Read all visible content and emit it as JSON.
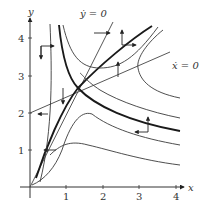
{
  "figure": {
    "type": "phase-portrait",
    "axes": {
      "x_label": "x",
      "y_label": "y",
      "x_ticks": [
        "1",
        "2",
        "3",
        "4"
      ],
      "y_ticks": [
        "1",
        "2",
        "3",
        "4"
      ]
    },
    "nullclines": {
      "ydot": "ẏ = 0",
      "xdot": "ẋ = 0"
    },
    "equilibrium": {
      "x": 1.3,
      "y": 2.65
    },
    "colors": {
      "ink": "#333333",
      "background": "#ffffff"
    }
  }
}
